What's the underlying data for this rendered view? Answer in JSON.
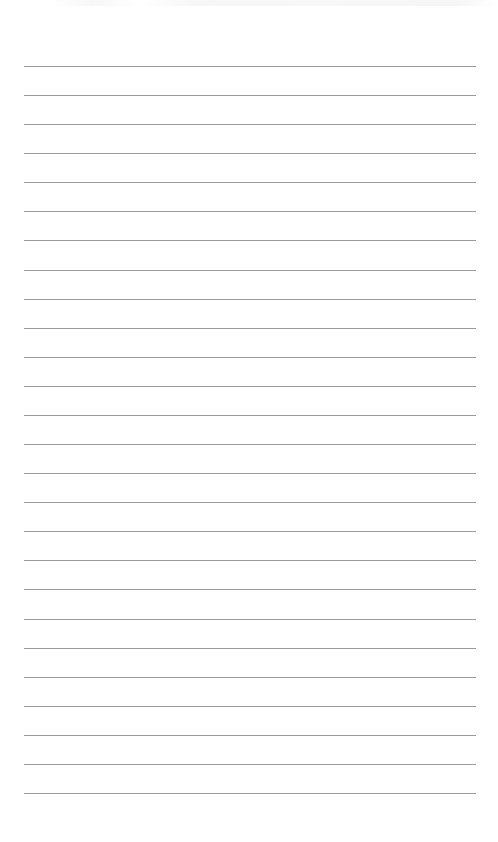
{
  "page": {
    "type": "lined-paper",
    "background_color": "#ffffff",
    "rule_color": "#8a8a8a",
    "rule_count": 26,
    "first_rule_y": 66,
    "rule_spacing": 29.08,
    "rule_left": 24,
    "rule_right": 476
  }
}
